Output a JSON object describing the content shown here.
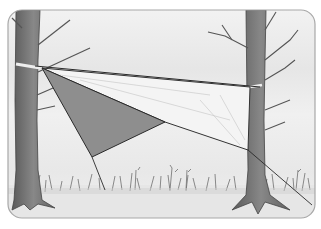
{
  "image": {
    "subject": "pencil sketch of a tarp shelter strung between two trees",
    "colors": {
      "frame": "#a8a8a8",
      "sky": "#ececec",
      "ground": "#e4e4e4",
      "tree": "#6e6e6e",
      "tarp_dark": "#8c8c8c",
      "tarp_light": "#f2f2f2",
      "line": "#2a2a2a",
      "grass": "#7a7a7a"
    }
  }
}
